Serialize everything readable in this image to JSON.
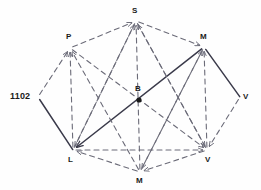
{
  "diagram": {
    "type": "directed-graph",
    "title": "",
    "background_color": "#fefefe",
    "solid_edge_color": "#3a3a4a",
    "dashed_edge_color": "#6b6b78",
    "label_color": "#1a1a1a",
    "nodes": [
      {
        "id": "n_1102",
        "label": "1102",
        "x": 38,
        "y": 97,
        "label_x": 10,
        "label_y": 92,
        "dot": false,
        "size": "big"
      },
      {
        "id": "n_P",
        "label": "P",
        "x": 70,
        "y": 48,
        "label_x": 66,
        "label_y": 33,
        "dot": false,
        "size": "small"
      },
      {
        "id": "n_S",
        "label": "S",
        "x": 136,
        "y": 21,
        "label_x": 132,
        "label_y": 7,
        "dot": false,
        "size": "small"
      },
      {
        "id": "n_Mtop",
        "label": "M",
        "x": 204,
        "y": 47,
        "label_x": 200,
        "label_y": 33,
        "dot": false,
        "size": "small"
      },
      {
        "id": "n_Vright",
        "label": "V",
        "x": 240,
        "y": 97,
        "label_x": 243,
        "label_y": 93,
        "dot": false,
        "size": "small"
      },
      {
        "id": "n_Vbot",
        "label": "V",
        "x": 207,
        "y": 150,
        "label_x": 205,
        "label_y": 156,
        "dot": false,
        "size": "small"
      },
      {
        "id": "n_Mbot",
        "label": "M",
        "x": 140,
        "y": 172,
        "label_x": 136,
        "label_y": 177,
        "dot": false,
        "size": "small"
      },
      {
        "id": "n_L",
        "label": "L",
        "x": 73,
        "y": 150,
        "label_x": 68,
        "label_y": 156,
        "dot": false,
        "size": "small"
      },
      {
        "id": "n_B",
        "label": "B",
        "x": 139,
        "y": 100,
        "label_x": 135,
        "label_y": 85,
        "dot": true,
        "size": "small"
      }
    ],
    "edges": [
      {
        "from": "n_1102",
        "to": "n_L",
        "style": "solid",
        "arrow": false
      },
      {
        "from": "n_Mtop",
        "to": "n_Vright",
        "style": "solid",
        "arrow": false
      },
      {
        "from": "n_Mtop",
        "to": "n_L",
        "style": "solid",
        "arrow": true
      },
      {
        "from": "n_1102",
        "to": "n_P",
        "style": "dashed",
        "arrow": true
      },
      {
        "from": "n_P",
        "to": "n_S",
        "style": "dashed",
        "arrow": true
      },
      {
        "from": "n_S",
        "to": "n_Mtop",
        "style": "dashed",
        "arrow": true
      },
      {
        "from": "n_Vright",
        "to": "n_Vbot",
        "style": "dashed",
        "arrow": true
      },
      {
        "from": "n_Vbot",
        "to": "n_Mbot",
        "style": "dashed",
        "arrow": true
      },
      {
        "from": "n_Mbot",
        "to": "n_L",
        "style": "dashed",
        "arrow": true
      },
      {
        "from": "n_L",
        "to": "n_P",
        "style": "dashed",
        "arrow": true
      },
      {
        "from": "n_L",
        "to": "n_S",
        "style": "dashed",
        "arrow": true
      },
      {
        "from": "n_Mbot",
        "to": "n_S",
        "style": "dashed",
        "arrow": true
      },
      {
        "from": "n_Mbot",
        "to": "n_P",
        "style": "dashed",
        "arrow": true
      },
      {
        "from": "n_Vbot",
        "to": "n_S",
        "style": "dashed",
        "arrow": true
      },
      {
        "from": "n_Vbot",
        "to": "n_Mtop",
        "style": "dashed",
        "arrow": true
      },
      {
        "from": "n_L",
        "to": "n_Vbot",
        "style": "dashed",
        "arrow": true
      },
      {
        "from": "n_Mbot",
        "to": "n_Mtop",
        "style": "dashed",
        "arrow": true
      },
      {
        "from": "n_P",
        "to": "n_Vbot",
        "style": "dashed",
        "arrow": true
      },
      {
        "from": "n_S",
        "to": "n_Vbot",
        "style": "dashed",
        "arrow": true
      },
      {
        "from": "n_S",
        "to": "n_L",
        "style": "dashed",
        "arrow": true
      },
      {
        "from": "n_Mtop",
        "to": "n_Mbot",
        "style": "dashed",
        "arrow": true
      }
    ]
  }
}
